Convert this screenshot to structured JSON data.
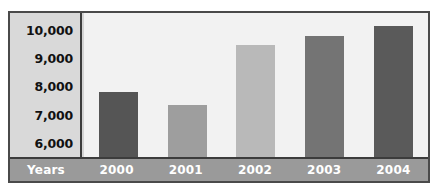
{
  "chart_data": {
    "type": "bar",
    "title": "",
    "xlabel": "Years",
    "ylabel": "",
    "categories": [
      "2000",
      "2001",
      "2002",
      "2003",
      "2004"
    ],
    "values": [
      7800,
      7350,
      9450,
      9800,
      10150
    ],
    "ylim": [
      5500,
      10600
    ],
    "yticks": [
      10000,
      9000,
      8000,
      7000,
      6000
    ],
    "ytick_labels": [
      "10,000",
      "9,000",
      "8,000",
      "7,000",
      "6,000"
    ],
    "grid": false,
    "legend": "none",
    "bar_colors": [
      "#555555",
      "#9e9e9e",
      "#b9b9b9",
      "#747474",
      "#5a5a5a"
    ]
  },
  "style": {
    "frame_border_color": "#4a4a4a",
    "axis_line_color": "#3c3c3c",
    "plot_background": "#f2f2f2",
    "y_axis_background": "#d9d9d9",
    "x_axis_background": "#9a9a9a",
    "x_axis_text_color": "#ffffff",
    "y_axis_text_color": "#111111",
    "page_background": "#ffffff"
  }
}
